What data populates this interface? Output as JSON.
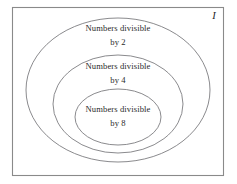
{
  "diagram": {
    "type": "venn-nested-ellipses",
    "universal_set_label": "I",
    "frame": {
      "x": 12,
      "y": 7,
      "width": 212,
      "height": 169,
      "stroke_color": "#8a8a8a",
      "fill_color": "#ffffff"
    },
    "sets": [
      {
        "id": "divisible-by-2",
        "label_line1": "Numbers divisible",
        "label_line2": "by 2",
        "divisor": "2",
        "cx": 118,
        "cy": 90,
        "rx": 92,
        "ry": 72,
        "label_x": 118,
        "label_y": 31,
        "label_y2": 45,
        "stroke_color": "#7d7d80"
      },
      {
        "id": "divisible-by-4",
        "label_line1": "Numbers divisible",
        "label_line2": "by 4",
        "divisor": "4",
        "cx": 118,
        "cy": 104,
        "rx": 65,
        "ry": 49,
        "label_x": 118,
        "label_y": 69,
        "label_y2": 83,
        "stroke_color": "#7d7d80"
      },
      {
        "id": "divisible-by-8",
        "label_line1": "Numbers divisible",
        "label_line2": "by 8",
        "divisor": "8",
        "cx": 118,
        "cy": 117,
        "rx": 43,
        "ry": 28,
        "label_x": 118,
        "label_y": 112,
        "label_y2": 126,
        "stroke_color": "#7d7d80"
      }
    ],
    "universal_label_x": 214,
    "universal_label_y": 19
  }
}
